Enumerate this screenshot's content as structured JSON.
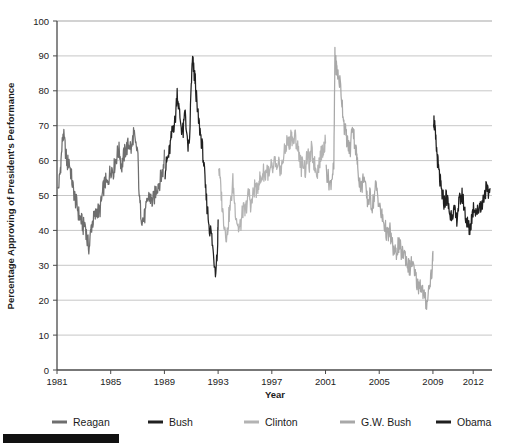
{
  "chart_data": {
    "type": "line",
    "title": "",
    "xlabel": "Year",
    "ylabel": "Percentage Approving of President's Performance",
    "xlim": [
      1981,
      2013.4
    ],
    "ylim": [
      0,
      100
    ],
    "xticks": [
      "1981",
      "1985",
      "1989",
      "1993",
      "1997",
      "2001",
      "2005",
      "2009",
      "2012"
    ],
    "xtick_values": [
      1981,
      1985,
      1989,
      1993,
      1997,
      2001,
      2005,
      2009,
      2012
    ],
    "yticks": [
      "0",
      "10",
      "20",
      "30",
      "40",
      "50",
      "60",
      "70",
      "80",
      "90",
      "100"
    ],
    "ytick_values": [
      0,
      10,
      20,
      30,
      40,
      50,
      60,
      70,
      80,
      90,
      100
    ],
    "grid": "horizontal",
    "legend_position": "bottom",
    "series": [
      {
        "name": "Reagan",
        "color": "#6e6e6e",
        "x": [
          1981.05,
          1981.2,
          1981.3,
          1981.45,
          1981.6,
          1981.75,
          1981.9,
          1982.05,
          1982.2,
          1982.35,
          1982.5,
          1982.65,
          1982.8,
          1982.95,
          1983.1,
          1983.25,
          1983.4,
          1983.55,
          1983.7,
          1983.85,
          1984.0,
          1984.15,
          1984.3,
          1984.45,
          1984.6,
          1984.75,
          1984.9,
          1985.05,
          1985.2,
          1985.35,
          1985.5,
          1985.65,
          1985.8,
          1985.95,
          1986.1,
          1986.25,
          1986.4,
          1986.55,
          1986.7,
          1986.85,
          1987.0,
          1987.15,
          1987.3,
          1987.45,
          1987.6,
          1987.75,
          1987.9,
          1988.05,
          1988.2,
          1988.35,
          1988.5,
          1988.65,
          1988.8,
          1988.95,
          1989.0
        ],
        "y": [
          51,
          55,
          60,
          68,
          64,
          59,
          60,
          56,
          52,
          49,
          47,
          44,
          43,
          41,
          42,
          37,
          35,
          41,
          43,
          44,
          46,
          45,
          48,
          52,
          54,
          53,
          56,
          58,
          57,
          60,
          62,
          63,
          58,
          61,
          63,
          64,
          65,
          63,
          68,
          64,
          63,
          48,
          44,
          43,
          45,
          49,
          50,
          48,
          49,
          51,
          53,
          54,
          56,
          58,
          63
        ]
      },
      {
        "name": "Bush",
        "color": "#202020",
        "x": [
          1989.05,
          1989.2,
          1989.35,
          1989.5,
          1989.65,
          1989.8,
          1989.95,
          1990.1,
          1990.25,
          1990.4,
          1990.55,
          1990.7,
          1990.85,
          1991.0,
          1991.1,
          1991.2,
          1991.3,
          1991.45,
          1991.6,
          1991.75,
          1991.9,
          1992.05,
          1992.2,
          1992.35,
          1992.5,
          1992.65,
          1992.8,
          1992.95,
          1993.0
        ],
        "y": [
          57,
          60,
          62,
          66,
          70,
          71,
          80,
          74,
          70,
          68,
          75,
          65,
          63,
          82,
          89,
          85,
          83,
          74,
          70,
          66,
          61,
          52,
          46,
          41,
          39,
          33,
          29,
          34,
          43
        ]
      },
      {
        "name": "Clinton",
        "color": "#b3b3b3",
        "x": [
          1993.05,
          1993.2,
          1993.35,
          1993.5,
          1993.65,
          1993.8,
          1993.95,
          1994.1,
          1994.25,
          1994.4,
          1994.55,
          1994.7,
          1994.85,
          1995.0,
          1995.15,
          1995.3,
          1995.45,
          1995.6,
          1995.75,
          1995.9,
          1996.05,
          1996.2,
          1996.35,
          1996.5,
          1996.65,
          1996.8,
          1996.95,
          1997.1,
          1997.25,
          1997.4,
          1997.55,
          1997.7,
          1997.85,
          1998.0,
          1998.15,
          1998.3,
          1998.45,
          1998.6,
          1998.75,
          1998.9,
          1999.05,
          1999.2,
          1999.35,
          1999.5,
          1999.65,
          1999.8,
          1999.95,
          2000.1,
          2000.25,
          2000.4,
          2000.55,
          2000.7,
          2000.85,
          2001.0
        ],
        "y": [
          58,
          52,
          45,
          41,
          38,
          44,
          48,
          54,
          47,
          43,
          40,
          42,
          46,
          45,
          48,
          51,
          47,
          50,
          53,
          51,
          55,
          54,
          57,
          56,
          58,
          55,
          58,
          57,
          60,
          56,
          59,
          57,
          61,
          63,
          66,
          64,
          68,
          65,
          67,
          64,
          62,
          58,
          60,
          57,
          62,
          59,
          63,
          60,
          58,
          57,
          60,
          62,
          64,
          65
        ]
      },
      {
        "name": "G.W. Bush",
        "color": "#a8a8a8",
        "x": [
          2001.05,
          2001.2,
          2001.35,
          2001.5,
          2001.62,
          2001.7,
          2001.75,
          2001.85,
          2001.95,
          2002.1,
          2002.25,
          2002.4,
          2002.55,
          2002.7,
          2002.85,
          2003.0,
          2003.15,
          2003.3,
          2003.4,
          2003.55,
          2003.7,
          2003.85,
          2004.0,
          2004.15,
          2004.3,
          2004.45,
          2004.6,
          2004.75,
          2004.9,
          2005.05,
          2005.2,
          2005.35,
          2005.5,
          2005.65,
          2005.8,
          2005.95,
          2006.1,
          2006.25,
          2006.4,
          2006.55,
          2006.7,
          2006.85,
          2007.0,
          2007.15,
          2007.3,
          2007.45,
          2007.6,
          2007.75,
          2007.9,
          2008.05,
          2008.2,
          2008.35,
          2008.5,
          2008.65,
          2008.8,
          2008.95,
          2009.0
        ],
        "y": [
          57,
          55,
          53,
          56,
          58,
          90,
          88,
          86,
          84,
          82,
          76,
          70,
          67,
          64,
          63,
          71,
          66,
          62,
          58,
          54,
          52,
          56,
          51,
          48,
          50,
          47,
          49,
          53,
          50,
          46,
          44,
          42,
          40,
          38,
          40,
          36,
          34,
          33,
          36,
          35,
          33,
          34,
          32,
          30,
          29,
          31,
          28,
          26,
          24,
          25,
          23,
          21,
          19,
          22,
          26,
          29,
          34
        ]
      },
      {
        "name": "Obama",
        "color": "#1f1f1f",
        "x": [
          2009.05,
          2009.12,
          2009.2,
          2009.3,
          2009.4,
          2009.5,
          2009.6,
          2009.7,
          2009.85,
          2010.0,
          2010.15,
          2010.3,
          2010.45,
          2010.6,
          2010.75,
          2010.9,
          2011.05,
          2011.2,
          2011.35,
          2011.5,
          2011.62,
          2011.75,
          2011.9,
          2012.05,
          2012.2,
          2012.35,
          2012.5,
          2012.65,
          2012.8,
          2012.95,
          2013.1,
          2013.25
        ],
        "y": [
          72,
          70,
          66,
          62,
          58,
          55,
          52,
          50,
          48,
          50,
          47,
          44,
          46,
          45,
          43,
          47,
          49,
          50,
          46,
          43,
          41,
          40,
          44,
          47,
          46,
          45,
          48,
          47,
          50,
          52,
          50,
          52
        ]
      }
    ]
  },
  "legend": {
    "items": [
      {
        "label": "Reagan",
        "color": "#6e6e6e"
      },
      {
        "label": "Bush",
        "color": "#202020"
      },
      {
        "label": "Clinton",
        "color": "#b3b3b3"
      },
      {
        "label": "G.W. Bush",
        "color": "#a8a8a8"
      },
      {
        "label": "Obama",
        "color": "#1f1f1f"
      }
    ]
  },
  "axes": {
    "x_title": "Year",
    "y_title": "Percentage Approving of President's Performance"
  }
}
